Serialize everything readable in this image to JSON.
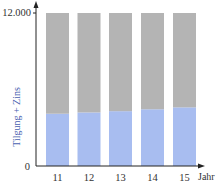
{
  "chart_data": {
    "type": "bar",
    "stacked": true,
    "title": "",
    "xlabel": "Jahr",
    "ylabel": "Tilgung + Zins",
    "ylim": [
      0,
      12000
    ],
    "yticks": [
      {
        "value": 0,
        "label": "0"
      },
      {
        "value": 12000,
        "label": "12.000"
      }
    ],
    "categories": [
      "11",
      "12",
      "13",
      "14",
      "15"
    ],
    "series": [
      {
        "name": "Tilgung",
        "color": "#a8bdf0",
        "values": [
          4100,
          4200,
          4300,
          4450,
          4600
        ]
      },
      {
        "name": "Zins",
        "color": "#b4b4b4",
        "values": [
          7900,
          7800,
          7700,
          7550,
          7400
        ]
      }
    ],
    "grid": false,
    "legend": "none"
  },
  "colors": {
    "axis": "#222222",
    "ylabel": "#4a5fb0",
    "tick": "#333333"
  }
}
